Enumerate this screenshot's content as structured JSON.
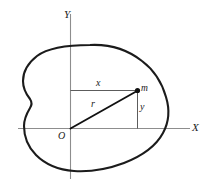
{
  "figure": {
    "background_color": "#ffffff",
    "width": 211,
    "height": 196,
    "axes": {
      "x_axis_label": "X",
      "y_axis_label": "Y",
      "origin_label": "O",
      "axis_color": "#8d8d8d"
    },
    "labels": {
      "x_component": "x",
      "y_component": "y",
      "radius_vector": "r",
      "mass_point": "m"
    },
    "outline": {
      "name": "rigid-body-outline",
      "color": "#1b1b1b",
      "stroke_width": 2.1
    },
    "vector": {
      "name": "position-vector",
      "color": "#111111",
      "from": "O",
      "to": "m"
    },
    "construction_color": "#4a4a4a"
  }
}
